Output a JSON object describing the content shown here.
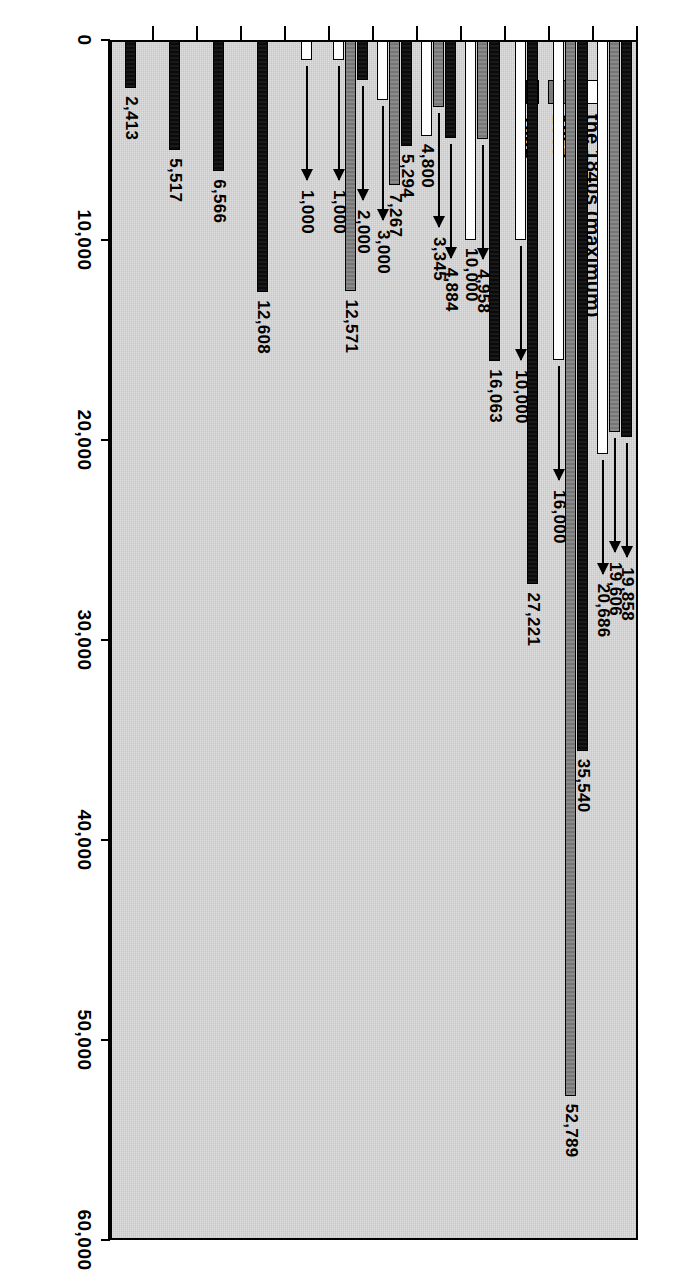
{
  "chart_data": {
    "type": "bar",
    "orientation": "horizontal",
    "title": "",
    "xlabel": "",
    "ylabel": "",
    "ylim": [
      0,
      60000
    ],
    "grid": false,
    "legend_position": "top-left inside plot",
    "axis_ticks": [
      "0",
      "10,000",
      "20,000",
      "30,000",
      "40,000",
      "50,000",
      "60,000"
    ],
    "axis_tick_values": [
      0,
      10000,
      20000,
      30000,
      40000,
      50000,
      60000
    ],
    "categories": [
      "Clergyman",
      "Civil servant",
      "Teacher",
      "Estate\nmanager",
      "Lawyer",
      "Physician\npharmacist",
      "Art, music\nliterature",
      "Technocrats",
      "White collar in\nindustry",
      "White collar in\ncommerce",
      "White collar in\ntransportation",
      "Bank clerks"
    ],
    "series": [
      {
        "name": "the 1840s (maximum)",
        "color": "#fdfdfd",
        "values": [
          20686,
          16000,
          10000,
          10000,
          4800,
          3000,
          1000,
          1000,
          null,
          null,
          null,
          null
        ],
        "labels": [
          "20,686",
          "16,000",
          "10,000",
          "10,000",
          "4,800",
          "3,000",
          "1,000",
          "1,000",
          "",
          "",
          "",
          ""
        ]
      },
      {
        "name": "1857",
        "color": "#7d7d7d",
        "values": [
          19606,
          52789,
          null,
          4958,
          3345,
          7267,
          12571,
          null,
          null,
          null,
          null,
          null
        ],
        "labels": [
          "19,606",
          "52,789",
          "",
          "4,958",
          "3,345",
          "7,267",
          "12,571",
          "",
          "",
          "",
          "",
          ""
        ]
      },
      {
        "name": "1869",
        "color": "#0d0d0d",
        "values": [
          19858,
          35540,
          27221,
          16063,
          4884,
          5294,
          2000,
          null,
          12608,
          6566,
          5517,
          2413
        ],
        "labels": [
          "19,858",
          "35,540",
          "27,221",
          "16,063",
          "4,884",
          "5,294",
          "2,000",
          "",
          "12,608",
          "6,566",
          "5,517",
          "2,413"
        ]
      }
    ]
  },
  "legend": {
    "entries": [
      {
        "label": "the 1840s (maximum)",
        "swatch": "white"
      },
      {
        "label": "1857",
        "swatch": "gray"
      },
      {
        "label": "1869",
        "swatch": "black"
      }
    ]
  },
  "axis": {
    "tick_labels": [
      "0",
      "10,000",
      "20,000",
      "30,000",
      "40,000",
      "50,000",
      "60,000"
    ]
  },
  "category_labels": [
    "Clergyman",
    "Civil servant",
    "Teacher",
    "Estate\nmanager",
    "Lawyer",
    "Physician\npharmacist",
    "Art, music\nliterature",
    "Technocrats",
    "White collar in\nindustry",
    "White collar in\ncommerce",
    "White collar in\ntransportation",
    "Bank clerks"
  ]
}
